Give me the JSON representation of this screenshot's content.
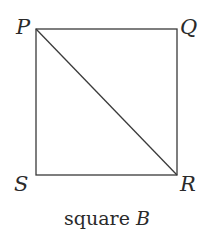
{
  "diagram": {
    "title": "square",
    "title_var": "B",
    "vertices": [
      {
        "label": "P",
        "x": 36,
        "y": 29
      },
      {
        "label": "Q",
        "x": 177,
        "y": 29
      },
      {
        "label": "R",
        "x": 177,
        "y": 175
      },
      {
        "label": "S",
        "x": 36,
        "y": 175
      }
    ],
    "diagonal": [
      "P",
      "R"
    ],
    "stroke_color": "#3a3a3a"
  }
}
